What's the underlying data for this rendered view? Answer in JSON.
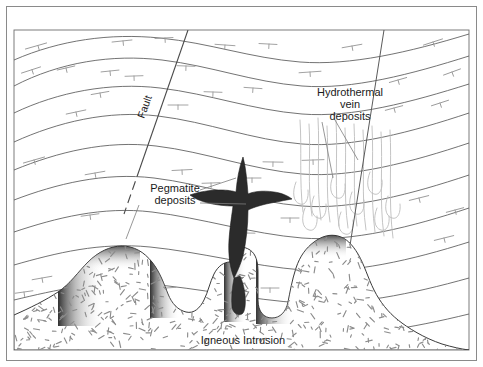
{
  "figure": {
    "type": "geologic-cross-section",
    "title_visible": false,
    "frame": {
      "outer_border_color": "#8a8a8a",
      "background": "#ffffff"
    }
  },
  "labels": {
    "fault": "Fault",
    "hydrothermal": {
      "line1": "Hydrothermal",
      "line2": "vein",
      "line3": "deposits"
    },
    "pegmatite": {
      "line1": "Pegmatite",
      "line2": "deposits"
    },
    "intrusion": "Igneous Intrusion"
  },
  "colors": {
    "strata_line": "#5a5a5a",
    "fault_line": "#4a4a4a",
    "vein_line": "#b9b9b9",
    "strike_dip": "#9a9a9a",
    "pegmatite_fill": "#2b2b2b",
    "intrusion_fill": "#ffffff",
    "intrusion_speckle": "#8c8c8c",
    "intrusion_shadow": "#2e2e2e",
    "label_text": "#1a1a1a",
    "leader_line": "#7d7d7d"
  },
  "features": [
    {
      "name": "sedimentary-strata",
      "count": 9,
      "description": "wavy sub-parallel bedding contacts"
    },
    {
      "name": "normal-fault",
      "description": "steeply dipping fault cutting left-center strata"
    },
    {
      "name": "hydrothermal-veins",
      "description": "cluster of thin vertical veins above right intrusion flank"
    },
    {
      "name": "pegmatite-dike",
      "description": "dark branching dike rising from central intrusion cupola"
    },
    {
      "name": "igneous-intrusion",
      "description": "speckled pluton with two cupolas and a central apophysis"
    },
    {
      "name": "strike-dip-symbols",
      "count": 36,
      "description": "T-shaped bedding attitude symbols"
    }
  ]
}
